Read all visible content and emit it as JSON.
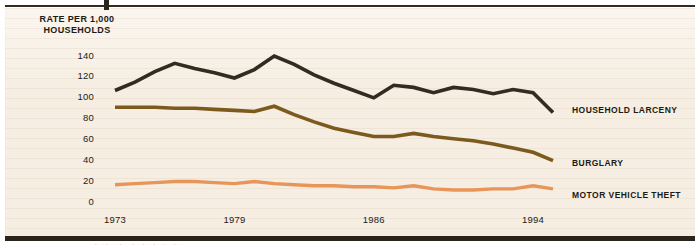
{
  "figure": {
    "background_color": "#f6eee2",
    "rule_color": "#2b241d",
    "bottom_noise_text": "• · ·· • · · ·· • · · · • ·· · • · ·· • · · • ·· · • · ··"
  },
  "chart_data": {
    "type": "line",
    "title": "",
    "ylabel": "RATE PER 1,000 HOUSEHOLDS",
    "xlabel": "",
    "ylim": [
      0,
      150
    ],
    "yticks": [
      0,
      20,
      40,
      60,
      80,
      100,
      120,
      140
    ],
    "xlim": [
      1973,
      1995
    ],
    "xticks": [
      1973,
      1979,
      1986,
      1994
    ],
    "grid": false,
    "legend_position": "right",
    "x": [
      1973,
      1974,
      1975,
      1976,
      1977,
      1978,
      1979,
      1980,
      1981,
      1982,
      1983,
      1984,
      1985,
      1986,
      1987,
      1988,
      1989,
      1990,
      1991,
      1992,
      1993,
      1994,
      1995
    ],
    "series": [
      {
        "name": "HOUSEHOLD LARCENY",
        "color": "#332b21",
        "values": [
          107,
          115,
          125,
          133,
          128,
          124,
          119,
          127,
          140,
          132,
          122,
          114,
          107,
          100,
          112,
          110,
          105,
          110,
          108,
          104,
          108,
          105,
          86
        ]
      },
      {
        "name": "BURGLARY",
        "color": "#7c5a1e",
        "values": [
          91,
          91,
          91,
          90,
          90,
          89,
          88,
          87,
          92,
          84,
          77,
          71,
          67,
          63,
          63,
          66,
          63,
          61,
          59,
          56,
          52,
          48,
          40
        ]
      },
      {
        "name": "MOTOR VEHICLE THEFT",
        "color": "#e8955a",
        "values": [
          17,
          18,
          19,
          20,
          20,
          19,
          18,
          20,
          18,
          17,
          16,
          16,
          15,
          15,
          14,
          16,
          13,
          12,
          12,
          13,
          13,
          16,
          13
        ]
      }
    ]
  },
  "legend": [
    {
      "label": "HOUSEHOLD LARCENY"
    },
    {
      "label": "BURGLARY"
    },
    {
      "label": "MOTOR VEHICLE THEFT"
    }
  ],
  "axis": {
    "y_title_line1": "RATE PER 1,000",
    "y_title_line2": "HOUSEHOLDS"
  }
}
